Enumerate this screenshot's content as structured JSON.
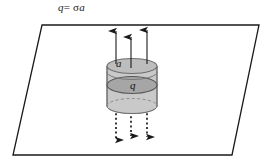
{
  "figure": {
    "equation": {
      "lhs": "q",
      "operator": "=",
      "sigma": "σ",
      "rhs_area": "a",
      "full_text": "q= σa"
    },
    "labels": {
      "area_label": "a",
      "charge_label": "q"
    },
    "colors": {
      "plane_stroke": "#1a1a1a",
      "cylinder_fill": "#c9c9c9",
      "cylinder_top_fill": "#bdbdbd",
      "cylinder_mid_fill": "#a6a6a6",
      "cylinder_stroke": "#6e6e6e",
      "arrow_solid": "#1a1a1a",
      "arrow_dotted": "#1a1a1a",
      "background": "#ffffff"
    },
    "geometry": {
      "plane_corners": "42,25 259,25 232,155 13,155",
      "cylinder_left_x": 107,
      "cylinder_right_x": 157,
      "cylinder_top_y": 66,
      "cylinder_bottom_y": 106
    },
    "field_arrows": {
      "up_count": 3,
      "down_count": 3,
      "up_style": "solid",
      "down_style": "dotted",
      "up_x_positions": [
        116,
        131,
        147
      ],
      "down_x_positions": [
        116,
        131,
        147
      ]
    }
  }
}
